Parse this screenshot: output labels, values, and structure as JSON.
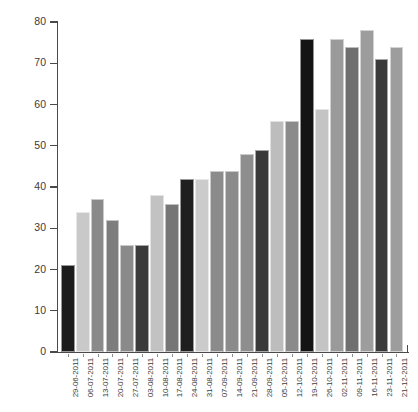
{
  "chart": {
    "title": "",
    "axis": {
      "y_ticks": [
        "0",
        "10",
        "20",
        "30",
        "40",
        "50",
        "60",
        "70",
        "80"
      ]
    }
  },
  "chart_data": {
    "type": "bar",
    "title": "",
    "xlabel": "",
    "ylabel": "",
    "ylim": [
      0,
      80
    ],
    "grid": false,
    "legend": "none",
    "yticks": [
      0,
      10,
      20,
      30,
      40,
      50,
      60,
      70,
      80
    ],
    "categories": [
      "29-06-2011",
      "06-07-2011",
      "13-07-2011",
      "20-07-2011",
      "27-07-2011",
      "03-08-2011",
      "10-08-2011",
      "17-08-2011",
      "24-08-2011",
      "31-08-2011",
      "07-09-2011",
      "14-09-2011",
      "21-09-2011",
      "28-09-2011",
      "05-10-2011",
      "12-10-2011",
      "19-10-2011",
      "26-10-2011",
      "02-11-2011",
      "09-11-2011",
      "16-11-2011",
      "23-11-2011",
      "21-12-2011"
    ],
    "values": [
      21,
      34,
      37,
      32,
      26,
      26,
      38,
      36,
      42,
      42,
      44,
      44,
      48,
      49,
      56,
      56,
      76,
      59,
      76,
      74,
      78,
      71,
      74
    ],
    "bar_colors": [
      "#1c1c1c",
      "#c9c9c9",
      "#8a8a8a",
      "#7d7d7d",
      "#8a8a8a",
      "#3a3a3a",
      "#c2c2c2",
      "#767676",
      "#1f1f1f",
      "#cbcbcb",
      "#8b8b8b",
      "#8b8b8b",
      "#8e8e8e",
      "#3a3a3a",
      "#bdbdbd",
      "#8b8b8b",
      "#141414",
      "#c4c4c4",
      "#9a9a9a",
      "#6f6f6f",
      "#9d9d9d",
      "#3a3a3a",
      "#9d9d9d"
    ]
  }
}
